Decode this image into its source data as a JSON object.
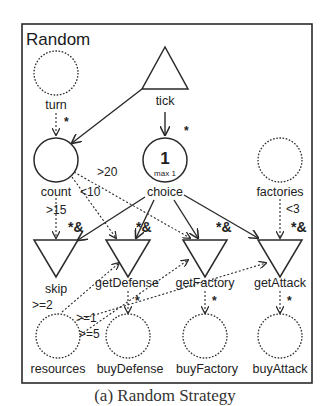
{
  "diagram": {
    "title": "Random",
    "caption": "(a) Random Strategy",
    "colors": {
      "stroke": "#2a2a2a",
      "background": "#ffffff"
    },
    "nodes": {
      "turn": {
        "label": "turn",
        "type": "pool",
        "style": "dotted"
      },
      "tick": {
        "label": "tick",
        "type": "source",
        "style": "solid"
      },
      "count": {
        "label": "count",
        "type": "pool",
        "style": "solid"
      },
      "choice": {
        "label": "choice",
        "type": "pool",
        "style": "solid",
        "value": "1",
        "capacity": "max 1"
      },
      "factories": {
        "label": "factories",
        "type": "pool",
        "style": "dotted"
      },
      "skip": {
        "label": "skip",
        "type": "drain"
      },
      "getDefense": {
        "label": "getDefense",
        "type": "drain"
      },
      "getFactory": {
        "label": "getFactory",
        "type": "drain"
      },
      "getAttack": {
        "label": "getAttack",
        "type": "drain"
      },
      "resources": {
        "label": "resources",
        "type": "pool",
        "style": "dotted"
      },
      "buyDefense": {
        "label": "buyDefense",
        "type": "pool",
        "style": "dotted"
      },
      "buyFactory": {
        "label": "buyFactory",
        "type": "pool",
        "style": "dotted"
      },
      "buyAttack": {
        "label": "buyAttack",
        "type": "pool",
        "style": "dotted"
      }
    },
    "edge_labels": {
      "turn_to_count": "*",
      "tick_to_choice": "*",
      "count_gt20": ">20",
      "count_lt10": "<10",
      "count_gt15": ">15",
      "factories_lt3": "<3",
      "skip_mod": "*&",
      "getDefense_mod": "*&",
      "getFactory_mod": "*&",
      "getAttack_mod": "*&",
      "resources_ge2": ">=2",
      "resources_ge1": ">=1",
      "resources_ge5": ">=5",
      "getDefense_out": "*",
      "getFactory_out": "*",
      "getAttack_out": "*"
    }
  }
}
